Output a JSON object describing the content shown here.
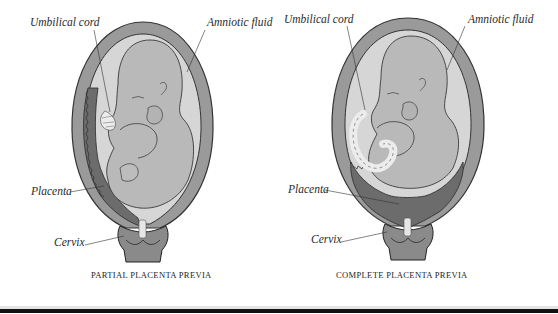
{
  "figure": {
    "panels": [
      {
        "id": "partial",
        "caption": "PARTIAL PLACENTA PREVIA",
        "labels": {
          "umbilical_cord": "Umbilical cord",
          "amniotic_fluid": "Amniotic fluid",
          "placenta": "Placenta",
          "cervix": "Cervix"
        }
      },
      {
        "id": "complete",
        "caption": "COMPLETE PLACENTA PREVIA",
        "labels": {
          "umbilical_cord": "Umbilical cord",
          "amniotic_fluid": "Amniotic fluid",
          "placenta": "Placenta",
          "cervix": "Cervix"
        }
      }
    ],
    "colors": {
      "uterine_wall": "#9a9a9a",
      "amniotic_fluid": "#d4d4d4",
      "fetus": "#b8b8b8",
      "placenta": "#6e6e6e",
      "outline": "#3a3a3a",
      "cord": "#e8e8e8",
      "rule": "#111111"
    }
  }
}
